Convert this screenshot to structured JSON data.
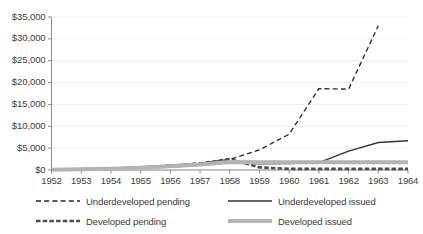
{
  "chart_data": {
    "type": "line",
    "title": "",
    "xlabel": "",
    "ylabel": "",
    "x": [
      1952,
      1953,
      1954,
      1955,
      1956,
      1957,
      1958,
      1959,
      1960,
      1961,
      1962,
      1963,
      1964
    ],
    "categories": [
      "1952",
      "1953",
      "1954",
      "1955",
      "1956",
      "1957",
      "1958",
      "1959",
      "1960",
      "1961",
      "1962",
      "1963",
      "1964"
    ],
    "ylim": [
      0,
      35000
    ],
    "ytick_values": [
      0,
      5000,
      10000,
      15000,
      20000,
      25000,
      30000,
      35000
    ],
    "ytick_labels": [
      "$0",
      "$5,000",
      "$10,000",
      "$15,000",
      "$20,000",
      "$25,000",
      "$30,000",
      "$35,000"
    ],
    "grid": true,
    "legend_position": "bottom",
    "series": [
      {
        "name": "Underdeveloped pending",
        "style": "dashed",
        "color": "#262626",
        "width": 1.3,
        "values": [
          100,
          200,
          350,
          700,
          1100,
          1600,
          2400,
          4600,
          8200,
          18600,
          18500,
          33000,
          null
        ]
      },
      {
        "name": "Underdeveloped issued",
        "style": "solid",
        "color": "#333333",
        "width": 1.4,
        "values": [
          60,
          120,
          220,
          420,
          700,
          1100,
          1700,
          1400,
          1500,
          1700,
          4300,
          6300,
          6700
        ]
      },
      {
        "name": "Developed pending",
        "style": "thick-dashed",
        "color": "#4d4d4d",
        "width": 2.6,
        "values": [
          90,
          180,
          320,
          620,
          1000,
          1500,
          2500,
          600,
          250,
          250,
          250,
          250,
          250
        ]
      },
      {
        "name": "Developed issued",
        "style": "thick-solid",
        "color": "#b3b3b3",
        "width": 4.0,
        "values": [
          80,
          150,
          280,
          520,
          850,
          1250,
          1850,
          1800,
          1800,
          1800,
          1800,
          1800,
          1800
        ]
      }
    ]
  },
  "legend": {
    "items": [
      {
        "label": "Underdeveloped pending",
        "swatch": "dashed-thin-swatch"
      },
      {
        "label": "Underdeveloped issued",
        "swatch": "solid-thin-swatch"
      },
      {
        "label": "Developed pending",
        "swatch": "dashed-thick-swatch"
      },
      {
        "label": "Developed issued",
        "swatch": "solid-thick-swatch"
      }
    ]
  },
  "colors": {
    "background": "#ffffff",
    "gridline": "#eeeeee",
    "axis": "#8c8c8c",
    "text": "#3a3a3a"
  }
}
